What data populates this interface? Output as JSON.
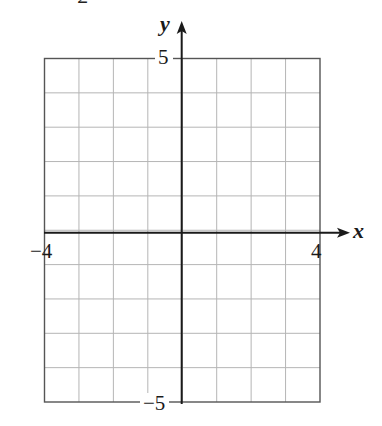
{
  "chart_data": {
    "type": "scatter",
    "title": "",
    "xlabel": "x",
    "ylabel": "y",
    "xlim": [
      -4,
      4
    ],
    "ylim": [
      -5,
      5
    ],
    "grid": true,
    "grid_step_x": 1,
    "grid_step_y": 1,
    "x_tick_labels": [
      {
        "value": -4,
        "label": "−4"
      },
      {
        "value": 4,
        "label": "4"
      }
    ],
    "y_tick_labels": [
      {
        "value": 5,
        "label": "5"
      },
      {
        "value": -5,
        "label": "−5"
      }
    ],
    "series": [],
    "legend": null
  },
  "labels": {
    "x_axis": "x",
    "y_axis": "y",
    "x_min": "−4",
    "x_max": "4",
    "y_max": "5",
    "y_min": "−5",
    "cut_off_header": "2"
  },
  "colors": {
    "axis": "#1a1a1a",
    "border": "#555555",
    "grid": "#b5b5b5",
    "background": "#ffffff"
  }
}
